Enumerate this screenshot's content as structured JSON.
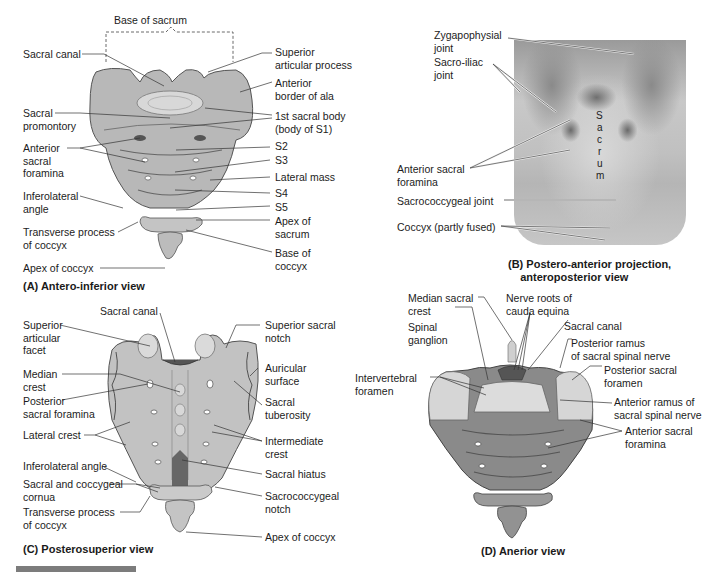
{
  "figure": {
    "panels": {
      "A": {
        "caption": "(A) Antero-inferior view",
        "bracket_label": "Base of sacrum",
        "labels_left": [
          "Sacral canal",
          "Sacral\npromontory",
          "Anterior\nsacral\nforamina",
          "Inferolateral\nangle",
          "Transverse process\nof coccyx",
          "Apex of coccyx"
        ],
        "labels_right": [
          "Superior\narticular process",
          "Anterior\nborder of ala",
          "1st sacral body\n(body of S1)",
          "S2",
          "S3",
          "Lateral mass",
          "S4",
          "S5",
          "Apex of\nsacrum",
          "Base of\ncoccyx"
        ]
      },
      "B": {
        "caption": "(B) Postero-anterior projection,\n    anteroposterior view",
        "xray_text": [
          "S",
          "a",
          "c",
          "r",
          "u",
          "m"
        ],
        "labels_left": [
          "Zygapophysial\njoint",
          "Sacro-iliac\njoint",
          "Anterior sacral\nforamina",
          "Sacrococcygeal joint",
          "Coccyx (partly fused)"
        ]
      },
      "C": {
        "caption": "(C) Posterosuperior view",
        "labels_top": [
          "Sacral canal"
        ],
        "labels_left": [
          "Superior\narticular\nfacet",
          "Median\ncrest",
          "Posterior\nsacral foramina",
          "Lateral crest",
          "Inferolateral angle",
          "Sacral and coccygeal\ncornua",
          "Transverse process\nof coccyx"
        ],
        "labels_right": [
          "Superior sacral\nnotch",
          "Auricular\nsurface",
          "Sacral\ntuberosity",
          "Intermediate\ncrest",
          "Sacral hiatus",
          "Sacrococcygeal\nnotch",
          "Apex of coccyx"
        ]
      },
      "D": {
        "caption": "(D) Anerior view",
        "labels_left": [
          "Median sacral\ncrest",
          "Spinal\nganglion",
          "Intervertebral\nforamen"
        ],
        "labels_top": [
          "Nerve roots of\ncauda equina"
        ],
        "labels_right": [
          "Sacral canal",
          "Posterior ramus\nof sacral spinal nerve",
          "Posterior sacral\nforamen",
          "Anterior ramus of\nsacral spinal nerve",
          "Anterior sacral\nforamina"
        ]
      }
    },
    "colors": {
      "bone_light": "#d6d6d6",
      "bone_mid": "#a8a8a8",
      "bone_dark": "#6e6e6e",
      "leader": "#333333"
    }
  }
}
